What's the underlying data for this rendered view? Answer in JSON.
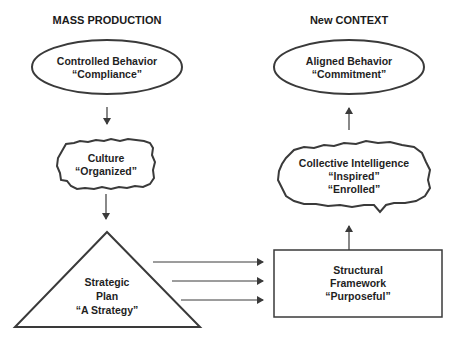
{
  "headers": {
    "left": "MASS PRODUCTION",
    "right": "New CONTEXT"
  },
  "nodes": {
    "controlled_behavior": {
      "shape": "ellipse",
      "line1": "Controlled Behavior",
      "line2": "“Compliance”"
    },
    "culture": {
      "shape": "cloud",
      "line1": "Culture",
      "line2": "“Organized”"
    },
    "strategic_plan": {
      "shape": "triangle",
      "line1": "Strategic",
      "line2": "Plan",
      "line3": "“A Strategy”"
    },
    "structural_framework": {
      "shape": "rectangle",
      "line1": "Structural",
      "line2": "Framework",
      "line3": "“Purposeful”"
    },
    "collective_intelligence": {
      "shape": "cloud",
      "line1": "Collective Intelligence",
      "line2": "“Inspired”",
      "line3": "“Enrolled”"
    },
    "aligned_behavior": {
      "shape": "ellipse",
      "line1": "Aligned Behavior",
      "line2": "“Commitment”"
    }
  },
  "edges": [
    {
      "from": "controlled_behavior",
      "to": "culture"
    },
    {
      "from": "culture",
      "to": "strategic_plan"
    },
    {
      "from": "strategic_plan",
      "to": "structural_framework",
      "count": 3
    },
    {
      "from": "structural_framework",
      "to": "collective_intelligence"
    },
    {
      "from": "collective_intelligence",
      "to": "aligned_behavior"
    }
  ],
  "colors": {
    "stroke": "#3a3a3a",
    "text": "#1f1f1f",
    "background": "#ffffff"
  }
}
